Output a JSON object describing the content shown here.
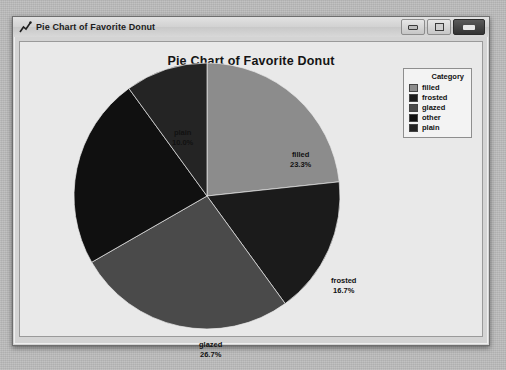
{
  "window": {
    "title": "Pie Chart of Favorite Donut",
    "icon": "line-chart-icon",
    "buttons": {
      "minimize": "Minimize",
      "maximize": "Maximize",
      "close": "Close"
    }
  },
  "legend": {
    "title": "Category",
    "items": [
      {
        "label": "filled",
        "color": "#8c8c8c"
      },
      {
        "label": "frosted",
        "color": "#1b1b1b"
      },
      {
        "label": "glazed",
        "color": "#4a4a4a"
      },
      {
        "label": "other",
        "color": "#101010"
      },
      {
        "label": "plain",
        "color": "#242424"
      }
    ]
  },
  "chart_data": {
    "type": "pie",
    "title": "Pie Chart of Favorite Donut",
    "xlabel": "",
    "ylabel": "",
    "legend_title": "Category",
    "legend_position": "top-right",
    "start_angle_deg": 0,
    "direction": "clockwise",
    "categories": [
      "filled",
      "frosted",
      "glazed",
      "other",
      "plain"
    ],
    "values": [
      23.3,
      16.7,
      26.7,
      23.3,
      10.0
    ],
    "value_unit": "percent",
    "colors": [
      "#8c8c8c",
      "#1b1b1b",
      "#4a4a4a",
      "#101010",
      "#242424"
    ],
    "labels": [
      {
        "name": "filled",
        "percent": "23.3%"
      },
      {
        "name": "frosted",
        "percent": "16.7%"
      },
      {
        "name": "glazed",
        "percent": "26.7%"
      },
      {
        "name": "other",
        "percent": "23.3%"
      },
      {
        "name": "plain",
        "percent": "10.0%"
      }
    ]
  }
}
